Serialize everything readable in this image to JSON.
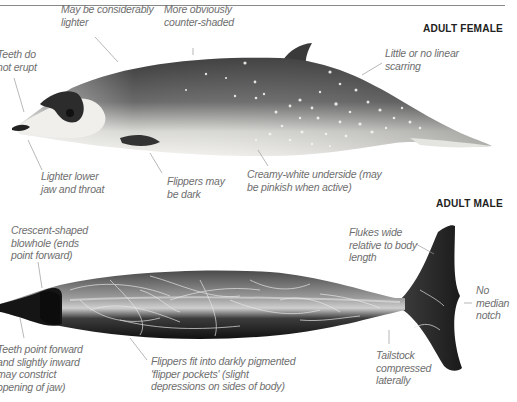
{
  "header": {
    "running_title": "STRANDINGS – BEAKED WHALES · BEAKED WHALES",
    "page_number": "245"
  },
  "female": {
    "title": "ADULT FEMALE",
    "labels": {
      "teeth": "Teeth do\nnot erupt",
      "lighter": "May be considerably\nlighter",
      "countershaded": "More obviously\ncounter-shaded",
      "scarring": "Little or no linear\nscarring",
      "jaw": "Lighter lower\njaw and throat",
      "flippers": "Flippers may\nbe dark",
      "underside": "Creamy-white underside (may\nbe pinkish when active)"
    }
  },
  "male": {
    "title": "ADULT MALE",
    "labels": {
      "blowhole": "Crescent-shaped\nblowhole (ends\npoint forward)",
      "flukes": "Flukes wide\nrelative to body\nlength",
      "notch": "No\nmedian\nnotch",
      "teeth": "Teeth point forward\nand slightly inward\nmay constrict\nopening of jaw)",
      "flipper_pockets": "Flippers fit into darkly pigmented\n'flipper pockets' (slight\ndepressions on sides of body)",
      "tailstock": "Tailstock\ncompressed\nlaterally"
    }
  },
  "colors": {
    "label_text": "#6e6e6e",
    "leader_line": "#9a9a9a",
    "title_text": "#222222",
    "whale_dark": "#1c1c1c",
    "whale_mid": "#5a5a5a",
    "whale_light": "#e9e9e6"
  }
}
